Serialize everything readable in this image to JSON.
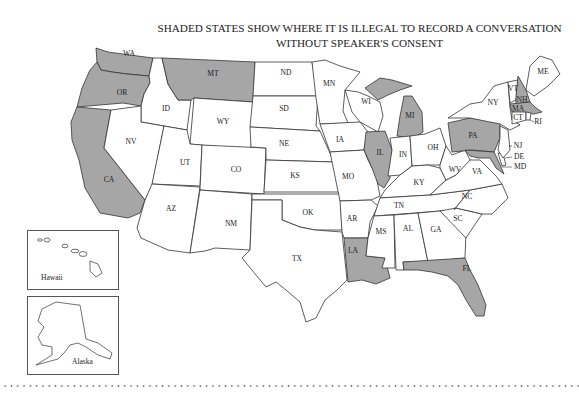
{
  "title": {
    "line1": "SHADED STATES SHOW WHERE IT IS ILLEGAL TO RECORD A CONVERSATION",
    "line2": "WITHOUT SPEAKER'S CONSENT"
  },
  "colors": {
    "shaded": "#a6a6a6",
    "unshaded": "#ffffff",
    "border": "#333333"
  },
  "shaded_states": [
    "WA",
    "OR",
    "CA",
    "MT",
    "IL",
    "MI",
    "PA",
    "NH",
    "MA",
    "MD",
    "FL",
    "LA",
    "CT"
  ],
  "states": {
    "WA": "WA",
    "OR": "OR",
    "CA": "CA",
    "ID": "ID",
    "NV": "NV",
    "MT": "MT",
    "WY": "WY",
    "UT": "UT",
    "AZ": "AZ",
    "CO": "CO",
    "NM": "NM",
    "ND": "ND",
    "SD": "SD",
    "NE": "NE",
    "KS": "KS",
    "OK": "OK",
    "TX": "TX",
    "MN": "MN",
    "IA": "IA",
    "MO": "MO",
    "AR": "AR",
    "LA": "LA",
    "WI": "WI",
    "IL": "IL",
    "MI": "MI",
    "IN": "IN",
    "OH": "OH",
    "KY": "KY",
    "TN": "TN",
    "MS": "MS",
    "AL": "AL",
    "GA": "GA",
    "FL": "FL",
    "SC": "SC",
    "NC": "NC",
    "VA": "VA",
    "WV": "WV",
    "PA": "PA",
    "NY": "NY",
    "VT": "VT",
    "NH": "NH",
    "ME": "ME",
    "MA": "MA",
    "CT": "CT",
    "RI": "RI",
    "NJ": "NJ",
    "DE": "DE",
    "MD": "MD"
  },
  "insets": {
    "hawaii": "Hawaii",
    "alaska": "Alaska"
  }
}
